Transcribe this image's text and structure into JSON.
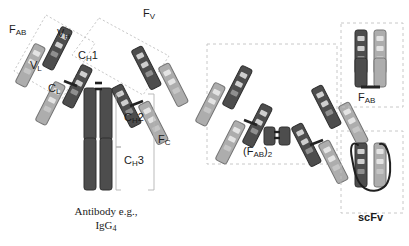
{
  "figure": {
    "background": "#ffffff",
    "width": 409,
    "height": 246
  },
  "colors": {
    "heavy_chain_dark": "#4d4d4d",
    "heavy_chain_dark_edge": "#2e2e2e",
    "light_chain_light": "#a9a9a9",
    "light_chain_light_edge": "#6f6f6f",
    "band_light": "#d9d9d9",
    "band_dark": "#8a8a8a",
    "hinge": "#2b2b2b",
    "dashed_box": "#b9b9b9",
    "bracket": "#a6a6a6",
    "text": "#1b1b1b"
  },
  "labels": {
    "fab_main": {
      "base": "F",
      "sub": "AB"
    },
    "vh": {
      "base": "V",
      "sub": "H"
    },
    "ch1": {
      "base": "C",
      "sub": "H",
      "tail": "1"
    },
    "vl": {
      "base": "V",
      "sub": "L"
    },
    "cl": {
      "base": "C",
      "sub": "L"
    },
    "fv": {
      "base": "F",
      "sub": "V"
    },
    "ch2": {
      "base": "C",
      "sub": "H",
      "tail": "2"
    },
    "ch3": {
      "base": "C",
      "sub": "H",
      "tail": "3"
    },
    "fc": {
      "base": "F",
      "sub": "C"
    },
    "fab2": {
      "base": "(F",
      "sub": "AB",
      "tail": ")",
      "sub2": "2"
    },
    "fab_fragment": {
      "base": "F",
      "sub": "AB"
    },
    "scfv": {
      "base": "scFv"
    }
  },
  "caption": {
    "line1": "Antibody e.g.,",
    "line2_base": "IgG",
    "line2_sub": "4"
  },
  "panels": [
    {
      "name": "antibody",
      "label": "Antibody e.g., IgG4",
      "dashed": false
    },
    {
      "name": "fab2",
      "label": "(FAB)2",
      "dashed": true
    },
    {
      "name": "fab",
      "label": "FAB",
      "dashed": true
    },
    {
      "name": "scfv",
      "label": "scFv",
      "dashed": true
    }
  ],
  "domains": {
    "antibody": [
      "VH",
      "CH1",
      "VL",
      "CL",
      "CH2",
      "CH3"
    ],
    "regions": [
      "FAB",
      "FV",
      "FC"
    ]
  }
}
